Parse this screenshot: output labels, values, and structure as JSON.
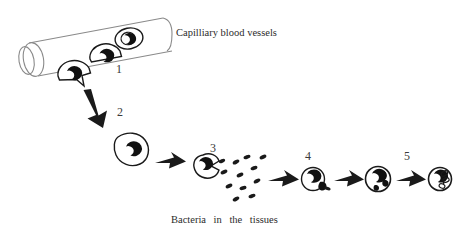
{
  "figure": {
    "title_top": "Capilliary blood vessels",
    "caption_bottom": "Bacteria in the tissues",
    "background_color": "#ffffff",
    "ink_color": "#1a1a1a",
    "outline_color": "#6e6e6e",
    "label_color": "#2b2b2b"
  },
  "stage_labels": {
    "one": "1",
    "two": "2",
    "three": "3",
    "four": "4",
    "five": "5"
  },
  "stages": [
    {
      "number": "1",
      "name": "leukocytes-in-capillary",
      "description": "White blood cells lining the inside of the capillary wall, one extending a pseudopod through the vessel wall",
      "cell_count": 3
    },
    {
      "number": "2",
      "name": "migrated-leukocyte",
      "description": "Amoeboid white blood cell that has left the capillary into the tissue",
      "cell_count": 1
    },
    {
      "number": "3",
      "name": "leukocyte-approaching-bacteria",
      "description": "Cell opens a cup-shaped notch toward the scattered bacteria",
      "cell_count": 1,
      "bacteria_count": 12
    },
    {
      "number": "4",
      "name": "leukocyte-engulfing-bacterium",
      "description": "Cell capturing a bacterium at its margin",
      "cell_count": 1
    },
    {
      "number": "",
      "name": "leukocyte-with-vacuoles",
      "description": "Rounded cell containing several ingested bacteria in vacuoles",
      "cell_count": 1
    },
    {
      "number": "5",
      "name": "leukocyte-digesting-bacteria",
      "description": "Rounded cell with bacteria being digested into small fragments",
      "cell_count": 1
    }
  ],
  "arrows": [
    {
      "name": "arrow-stage1-to-stage2",
      "direction": "down"
    },
    {
      "name": "arrow-stage2-to-stage3",
      "direction": "right"
    },
    {
      "name": "arrow-stage3-to-stage4",
      "direction": "right"
    },
    {
      "name": "arrow-stage4-to-vacuole-stage",
      "direction": "right"
    },
    {
      "name": "arrow-vacuole-to-stage5",
      "direction": "right"
    }
  ]
}
